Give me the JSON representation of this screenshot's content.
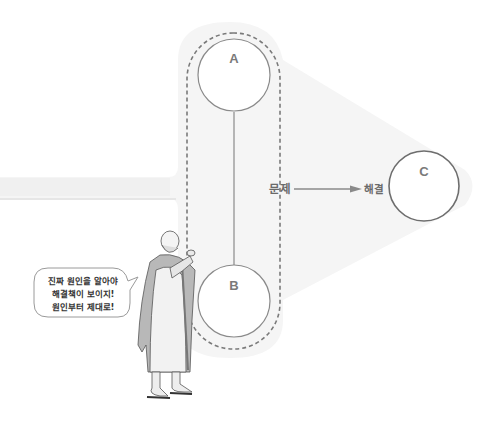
{
  "diagram": {
    "nodes": [
      {
        "id": "A",
        "label": "A"
      },
      {
        "id": "B",
        "label": "B"
      },
      {
        "id": "C",
        "label": "C"
      }
    ],
    "edges": [
      {
        "from": "A",
        "to": "B",
        "type": "line"
      },
      {
        "from": "problem",
        "to": "solution",
        "type": "arrow"
      }
    ],
    "group_label": "문제",
    "target_label": "해결",
    "speech_bubble": {
      "lines": [
        "진짜 원인을 알아야",
        "해결책이 보이지!",
        "원인부터 제대로!"
      ]
    },
    "colors": {
      "panel": "#f4f4f4",
      "stroke": "#8a8a8a",
      "dashed": "#7a7a7a",
      "circle_c": "#6e6e6e",
      "text": "#7a7a7a"
    }
  }
}
